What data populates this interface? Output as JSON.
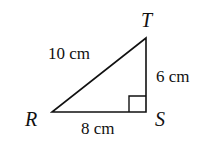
{
  "diagram": {
    "type": "right-triangle",
    "vertices": {
      "R": {
        "label": "R"
      },
      "S": {
        "label": "S"
      },
      "T": {
        "label": "T"
      }
    },
    "sides": {
      "RT": {
        "label": "10 cm"
      },
      "TS": {
        "label": "6 cm"
      },
      "RS": {
        "label": "8 cm"
      }
    },
    "right_angle_at": "S",
    "stroke_color": "#111111"
  }
}
